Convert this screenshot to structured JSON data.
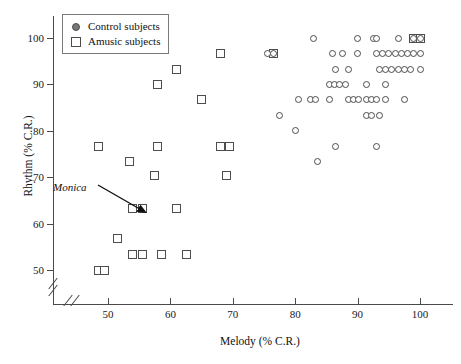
{
  "chart_data": {
    "type": "scatter",
    "title": "",
    "xlabel": "Melody (% C.R.)",
    "ylabel": "Rhythm (% C.R.)",
    "xlim": [
      46,
      102
    ],
    "ylim": [
      46,
      103
    ],
    "xticks": [
      50,
      60,
      70,
      80,
      90,
      100
    ],
    "yticks": [
      50,
      60,
      70,
      80,
      90,
      100
    ],
    "grid": false,
    "axis_breaks": [
      "x-origin",
      "y-origin"
    ],
    "legend": {
      "position": "top-left-inside",
      "entries": [
        {
          "label": "Control subjects",
          "marker": "circle"
        },
        {
          "label": "Amusic subjects",
          "marker": "square"
        }
      ]
    },
    "annotations": [
      {
        "text": "Monica",
        "style": "italic",
        "points_to": {
          "x": 54.0,
          "y": 63.3
        }
      }
    ],
    "series": [
      {
        "name": "Amusic subjects",
        "marker": "square",
        "points": [
          [
            99.0,
            100.0
          ],
          [
            100.0,
            100.0
          ],
          [
            76.5,
            96.7
          ],
          [
            68.0,
            96.7
          ],
          [
            61.0,
            93.3
          ],
          [
            58.0,
            90.0
          ],
          [
            65.0,
            86.7
          ],
          [
            48.5,
            76.7
          ],
          [
            58.0,
            76.7
          ],
          [
            68.0,
            76.7
          ],
          [
            69.5,
            76.7
          ],
          [
            53.5,
            73.3
          ],
          [
            57.5,
            70.3
          ],
          [
            69.0,
            70.3
          ],
          [
            54.0,
            63.3
          ],
          [
            55.5,
            63.3
          ],
          [
            61.0,
            63.3
          ],
          [
            51.5,
            56.7
          ],
          [
            54.0,
            53.3
          ],
          [
            55.5,
            53.3
          ],
          [
            58.5,
            53.3
          ],
          [
            62.5,
            53.3
          ],
          [
            48.5,
            50.0
          ],
          [
            49.5,
            50.0
          ]
        ]
      },
      {
        "name": "Control subjects",
        "marker": "circle",
        "points": [
          [
            90.0,
            100.0
          ],
          [
            92.5,
            100.0
          ],
          [
            93.0,
            100.0
          ],
          [
            96.5,
            100.0
          ],
          [
            99.0,
            100.0
          ],
          [
            100.0,
            100.0
          ],
          [
            83.0,
            100.0
          ],
          [
            75.5,
            96.7
          ],
          [
            76.5,
            96.7
          ],
          [
            86.0,
            96.7
          ],
          [
            87.5,
            96.7
          ],
          [
            90.0,
            96.7
          ],
          [
            93.0,
            96.7
          ],
          [
            94.0,
            96.7
          ],
          [
            95.0,
            96.7
          ],
          [
            96.0,
            96.7
          ],
          [
            97.0,
            96.7
          ],
          [
            98.0,
            96.7
          ],
          [
            99.0,
            96.7
          ],
          [
            100.0,
            96.7
          ],
          [
            86.5,
            93.3
          ],
          [
            88.5,
            93.3
          ],
          [
            93.5,
            93.3
          ],
          [
            94.5,
            93.3
          ],
          [
            95.5,
            93.3
          ],
          [
            96.5,
            93.3
          ],
          [
            97.5,
            93.3
          ],
          [
            98.5,
            93.3
          ],
          [
            100.0,
            93.3
          ],
          [
            85.5,
            90.0
          ],
          [
            86.3,
            90.0
          ],
          [
            87.1,
            90.0
          ],
          [
            88.0,
            90.0
          ],
          [
            91.5,
            90.0
          ],
          [
            94.5,
            90.0
          ],
          [
            80.5,
            86.7
          ],
          [
            82.5,
            86.7
          ],
          [
            83.3,
            86.7
          ],
          [
            85.5,
            86.7
          ],
          [
            88.5,
            86.7
          ],
          [
            89.3,
            86.7
          ],
          [
            90.1,
            86.7
          ],
          [
            91.5,
            86.7
          ],
          [
            92.3,
            86.7
          ],
          [
            93.0,
            86.7
          ],
          [
            94.5,
            86.7
          ],
          [
            97.5,
            86.7
          ],
          [
            77.5,
            83.3
          ],
          [
            91.5,
            83.3
          ],
          [
            92.3,
            83.3
          ],
          [
            93.5,
            83.3
          ],
          [
            80.0,
            80.0
          ],
          [
            86.5,
            76.7
          ],
          [
            93.0,
            76.7
          ],
          [
            83.5,
            73.3
          ]
        ]
      }
    ]
  },
  "axis": {
    "x_title": "Melody (% C.R.)",
    "y_title": "Rhythm (% C.R.)",
    "x_tick_labels": [
      "50",
      "60",
      "70",
      "80",
      "90",
      "100"
    ],
    "y_tick_labels": [
      "50",
      "60",
      "70",
      "80",
      "90",
      "100"
    ]
  },
  "legend": {
    "control_label": "Control subjects",
    "amusic_label": "Amusic subjects"
  },
  "annotation": {
    "monica_label": "Monica"
  }
}
